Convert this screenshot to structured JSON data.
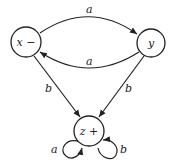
{
  "diagram": {
    "type": "finite-automaton",
    "nodes": [
      {
        "id": "x",
        "label": "x −",
        "role": "start"
      },
      {
        "id": "y",
        "label": "y",
        "role": "normal"
      },
      {
        "id": "z",
        "label": "z +",
        "role": "final"
      }
    ],
    "edges": [
      {
        "from": "x",
        "to": "y",
        "label": "a"
      },
      {
        "from": "y",
        "to": "x",
        "label": "a"
      },
      {
        "from": "x",
        "to": "z",
        "label": "b"
      },
      {
        "from": "y",
        "to": "z",
        "label": "b"
      },
      {
        "from": "z",
        "to": "z",
        "label": "a",
        "side": "left"
      },
      {
        "from": "z",
        "to": "z",
        "label": "b",
        "side": "right"
      }
    ]
  }
}
